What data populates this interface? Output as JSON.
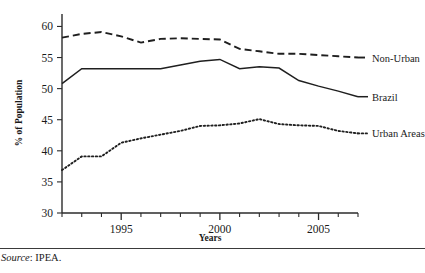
{
  "figure": {
    "source_prefix": "Source",
    "source_separator": ": ",
    "source_value": "IPEA."
  },
  "chart_data": {
    "type": "line",
    "title": "",
    "xlabel": "Years",
    "ylabel": "% of Population",
    "x": [
      1992,
      1993,
      1994,
      1995,
      1996,
      1997,
      1998,
      1999,
      2000,
      2001,
      2002,
      2003,
      2004,
      2005,
      2006,
      2007
    ],
    "xlim": [
      1992,
      2007
    ],
    "ylim": [
      30,
      62
    ],
    "xticks": [
      1992,
      1993,
      1994,
      1995,
      1996,
      1997,
      1998,
      1999,
      2000,
      2001,
      2002,
      2003,
      2004,
      2005,
      2006,
      2007
    ],
    "xtick_labels": [
      "",
      "",
      "",
      "1995",
      "",
      "",
      "",
      "",
      "2000",
      "",
      "",
      "",
      "",
      "2005",
      "",
      ""
    ],
    "yticks": [
      30,
      35,
      40,
      45,
      50,
      55,
      60
    ],
    "ytick_labels": [
      "30",
      "35",
      "40",
      "45",
      "50",
      "55",
      "60"
    ],
    "grid": false,
    "legend_position": "right-inline",
    "series": [
      {
        "name": "Non-Urban",
        "style": "dashed",
        "color": "#1f1f1f",
        "values": [
          58.2,
          58.8,
          59.1,
          58.4,
          57.4,
          58.0,
          58.1,
          58.0,
          57.9,
          56.4,
          56.0,
          55.6,
          55.6,
          55.4,
          55.2,
          55.0
        ]
      },
      {
        "name": "Brazil",
        "style": "solid",
        "color": "#1f1f1f",
        "values": [
          50.8,
          53.2,
          53.2,
          53.2,
          53.2,
          53.2,
          53.8,
          54.4,
          54.7,
          53.2,
          53.5,
          53.3,
          51.3,
          50.4,
          49.6,
          48.7
        ]
      },
      {
        "name": "Urban Areas",
        "style": "dotted",
        "color": "#1f1f1f",
        "values": [
          36.9,
          39.1,
          39.1,
          41.3,
          42.0,
          42.6,
          43.2,
          44.0,
          44.1,
          44.4,
          45.1,
          44.3,
          44.1,
          44.0,
          43.2,
          42.8
        ]
      }
    ]
  }
}
